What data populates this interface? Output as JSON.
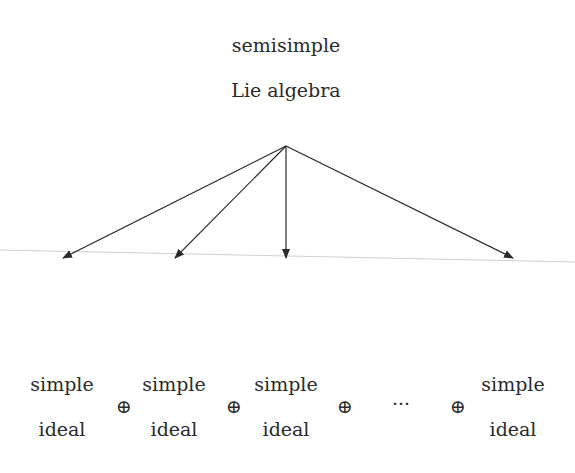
{
  "diagram": {
    "root": {
      "line1": "semisimple",
      "line2": "Lie algebra"
    },
    "ideals": [
      {
        "line1": "simple",
        "line2": "ideal"
      },
      {
        "line1": "simple",
        "line2": "ideal"
      },
      {
        "line1": "simple",
        "line2": "ideal"
      },
      {
        "line1": "simple",
        "line2": "ideal"
      }
    ],
    "operators": [
      "⊕",
      "⊕",
      "⊕",
      "⊕"
    ],
    "ellipsis": "···",
    "colors": {
      "ink": "#2a2a2a",
      "faint_line": "#d0d0d0"
    }
  }
}
